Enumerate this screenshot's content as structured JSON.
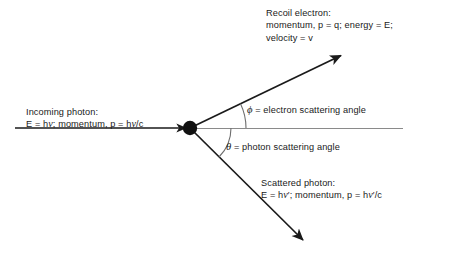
{
  "diagram": {
    "background_color": "#ffffff",
    "line_color": "#1a1a1a",
    "axis_color": "#7a7a7a",
    "arc_color": "#6e6e6e",
    "vertex": {
      "x": 190,
      "y": 128,
      "radius": 7,
      "name": "interaction-point"
    },
    "labels": {
      "recoil_electron": {
        "line1": "Recoil electron:",
        "line2_a": "momentum, p = q; energy = E;",
        "line3": "velocity = v"
      },
      "incoming_photon": {
        "line1": "Incoming photon:",
        "line2_pre": "E = h",
        "line2_nu": "ν",
        "line2_mid": "; momentum, p = h",
        "line2_nu2": "ν",
        "line2_post": "/c"
      },
      "scattered_photon": {
        "line1": "Scattered photon:",
        "line2_pre": "E = h",
        "line2_nu": "ν",
        "line2_mid": "′; momentum, p = h",
        "line2_nu2": "ν",
        "line2_post": "′/c"
      },
      "phi_angle": {
        "symbol": "ϕ",
        "text": " = electron scattering angle"
      },
      "theta_angle": {
        "symbol": "θ",
        "text": " = photon scattering angle"
      }
    },
    "vectors": [
      {
        "name": "incoming-photon-ray",
        "from": {
          "x": 15,
          "y": 128
        },
        "to": {
          "x": 190,
          "y": 128
        },
        "arrowhead": "end",
        "angle_deg": 0
      },
      {
        "name": "recoil-electron-ray",
        "from": {
          "x": 190,
          "y": 128
        },
        "to": {
          "x": 344,
          "y": 54
        },
        "arrowhead": "end",
        "angle_deg": 25.7
      },
      {
        "name": "scattered-photon-ray",
        "from": {
          "x": 190,
          "y": 128
        },
        "to": {
          "x": 306,
          "y": 243
        },
        "arrowhead": "end",
        "angle_deg": -44.7
      },
      {
        "name": "reference-axis-line",
        "from": {
          "x": 190,
          "y": 128
        },
        "to": {
          "x": 403,
          "y": 128
        },
        "arrowhead": "none",
        "angle_deg": 0
      }
    ],
    "arcs": [
      {
        "name": "phi-angle-arc",
        "radius": 56,
        "start_deg": 0,
        "end_deg": 25.7
      },
      {
        "name": "theta-angle-arc",
        "radius": 41,
        "start_deg": 0,
        "end_deg": -44.7
      }
    ]
  }
}
